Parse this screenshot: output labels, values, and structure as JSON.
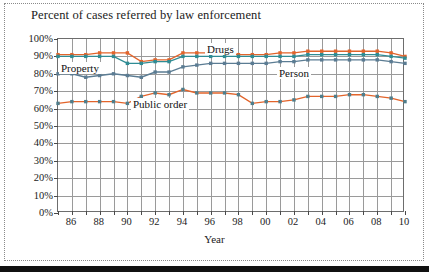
{
  "figure": {
    "title": "Percent of cases referred by law enforcement",
    "bottom_band_color": "#111111",
    "frame_color": "#8a8a8a"
  },
  "axis": {
    "x_title": "Year",
    "y_ticklabels": [
      "0%",
      "10%",
      "20%",
      "30%",
      "40%",
      "50%",
      "60%",
      "70%",
      "80%",
      "90%",
      "100%"
    ],
    "x_ticklabels": [
      "86",
      "88",
      "90",
      "92",
      "94",
      "96",
      "98",
      "00",
      "02",
      "04",
      "06",
      "08",
      "10"
    ]
  },
  "annotations": [
    {
      "name": "drugs",
      "label": "Drugs"
    },
    {
      "name": "property",
      "label": "Property"
    },
    {
      "name": "person",
      "label": "Person"
    },
    {
      "name": "public-order",
      "label": "Public order"
    }
  ],
  "colors": {
    "drugs": "#E2642B",
    "person": "#2F8C94",
    "property": "#5B7C93",
    "public_order_line": "#E2642B",
    "public_order_marker": "#4E7E8C",
    "grid": "#9a9a9a",
    "axis": "#6d6d6d"
  },
  "chart_data": {
    "type": "line",
    "title": "Percent of cases referred by law enforcement",
    "xlabel": "Year",
    "ylabel": "",
    "ylim": [
      0,
      100
    ],
    "y_unit": "%",
    "grid": true,
    "legend": "inline-annotations",
    "x": [
      1985,
      1986,
      1987,
      1988,
      1989,
      1990,
      1991,
      1992,
      1993,
      1994,
      1995,
      1996,
      1997,
      1998,
      1999,
      2000,
      2001,
      2002,
      2003,
      2004,
      2005,
      2006,
      2007,
      2008,
      2009,
      2010
    ],
    "x_display": [
      "85",
      "86",
      "87",
      "88",
      "89",
      "90",
      "91",
      "92",
      "93",
      "94",
      "95",
      "96",
      "97",
      "98",
      "99",
      "00",
      "01",
      "02",
      "03",
      "04",
      "05",
      "06",
      "07",
      "08",
      "09",
      "10"
    ],
    "series": [
      {
        "name": "Drugs",
        "color": "#E2642B",
        "values": [
          91,
          91,
          91,
          92,
          92,
          92,
          87,
          88,
          88,
          92,
          92,
          92,
          92,
          91,
          91,
          91,
          92,
          92,
          93,
          93,
          93,
          93,
          93,
          93,
          92,
          90
        ]
      },
      {
        "name": "Person",
        "color": "#2F8C94",
        "values": [
          90,
          90,
          90,
          90,
          90,
          86,
          86,
          87,
          87,
          90,
          90,
          90,
          90,
          90,
          90,
          90,
          90,
          90,
          91,
          91,
          91,
          91,
          91,
          91,
          90,
          89
        ]
      },
      {
        "name": "Property",
        "color": "#5B7C93",
        "values": [
          80,
          80,
          78,
          79,
          80,
          79,
          78,
          81,
          81,
          84,
          85,
          86,
          86,
          86,
          86,
          86,
          87,
          87,
          88,
          88,
          88,
          88,
          88,
          88,
          87,
          86
        ]
      },
      {
        "name": "Public order",
        "color": "#E2642B",
        "values": [
          63,
          64,
          64,
          64,
          64,
          63,
          67,
          69,
          68,
          71,
          69,
          69,
          69,
          68,
          63,
          64,
          64,
          65,
          67,
          67,
          67,
          68,
          68,
          67,
          66,
          64
        ]
      }
    ]
  }
}
